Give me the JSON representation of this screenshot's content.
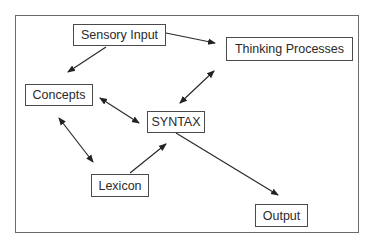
{
  "diagram": {
    "nodes": {
      "sensory_input": "Sensory Input",
      "thinking_processes": "Thinking Processes",
      "concepts": "Concepts",
      "syntax": "SYNTAX",
      "lexicon": "Lexicon",
      "output": "Output"
    },
    "edges": [
      {
        "from": "Sensory Input",
        "to": "Concepts",
        "direction": "one-way"
      },
      {
        "from": "Sensory Input",
        "to": "Thinking Processes",
        "direction": "one-way"
      },
      {
        "from": "Thinking Processes",
        "to": "SYNTAX",
        "direction": "two-way"
      },
      {
        "from": "Concepts",
        "to": "SYNTAX",
        "direction": "two-way"
      },
      {
        "from": "Concepts",
        "to": "Lexicon",
        "direction": "two-way"
      },
      {
        "from": "Lexicon",
        "to": "SYNTAX",
        "direction": "one-way"
      },
      {
        "from": "SYNTAX",
        "to": "Output",
        "direction": "one-way"
      }
    ],
    "colors": {
      "line": "#2a2a2a",
      "border": "#4a4a4a",
      "frame": "#6a6a6a"
    }
  }
}
